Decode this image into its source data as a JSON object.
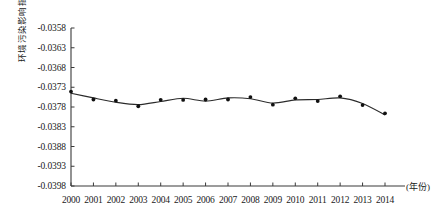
{
  "chart_data": {
    "type": "line",
    "title": "",
    "subtitle": "",
    "xlabel": "(年份)",
    "ylabel": "环境污染影响指数",
    "x": [
      2000,
      2001,
      2002,
      2003,
      2004,
      2005,
      2006,
      2007,
      2008,
      2009,
      2010,
      2011,
      2012,
      2013,
      2014
    ],
    "xtick_labels": [
      "2000",
      "2001",
      "2002",
      "2003",
      "2004",
      "2005",
      "2006",
      "2007",
      "2008",
      "2009",
      "2010",
      "2011",
      "2012",
      "2013",
      "2014"
    ],
    "values": [
      -0.03745,
      -0.03757,
      -0.03768,
      -0.03774,
      -0.03766,
      -0.03758,
      -0.03765,
      -0.03757,
      -0.03759,
      -0.0377,
      -0.03762,
      -0.03761,
      -0.03757,
      -0.03771,
      -0.038
    ],
    "ytick_labels": [
      "-0.0358",
      "-0.0363",
      "-0.0368",
      "-0.0373",
      "-0.0378",
      "-0.0383",
      "-0.0388",
      "-0.0393",
      "-0.0398"
    ],
    "ytick_values": [
      -0.0358,
      -0.0363,
      -0.0368,
      -0.0373,
      -0.0378,
      -0.0383,
      -0.0388,
      -0.0393,
      -0.0398
    ],
    "ylim": [
      -0.0398,
      -0.0358
    ],
    "xlim": [
      2000,
      2014
    ],
    "grid": false,
    "legend": null,
    "series": [
      {
        "name": "环境污染影响指数",
        "marker": "filled-circle",
        "line_color": "#2b2b2b",
        "marker_color": "#111111",
        "values": [
          -0.03745,
          -0.03757,
          -0.03768,
          -0.03774,
          -0.03766,
          -0.03758,
          -0.03765,
          -0.03757,
          -0.03759,
          -0.0377,
          -0.03762,
          -0.03761,
          -0.03757,
          -0.03771,
          -0.038
        ]
      }
    ],
    "axis_color": "#3a3a3a"
  }
}
